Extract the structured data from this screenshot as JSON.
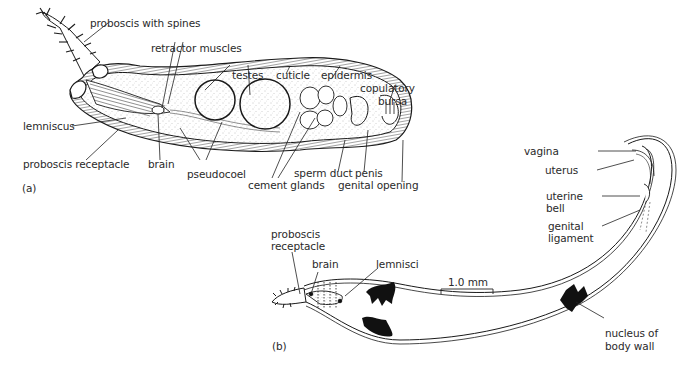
{
  "figure": {
    "panel_a": {
      "tag": "(a)",
      "labels": {
        "proboscis_spines": "proboscis with spines",
        "retractor_muscles": "retractor muscles",
        "testes": "testes",
        "cuticle": "cuticle",
        "epidermis": "epidermis",
        "copulatory_bursa_1": "copulatory",
        "copulatory_bursa_2": "bursa",
        "lemniscus": "lemniscus",
        "proboscis_receptacle": "proboscis receptacle",
        "brain": "brain",
        "pseudocoel": "pseudocoel",
        "cement_glands": "cement glands",
        "sperm_duct": "sperm duct",
        "penis": "penis",
        "genital_opening": "genital opening"
      }
    },
    "panel_b": {
      "tag": "(b)",
      "labels": {
        "proboscis_receptacle_1": "proboscis",
        "proboscis_receptacle_2": "receptacle",
        "brain": "brain",
        "lemnisci": "lemnisci",
        "scale_bar": "1.0 mm",
        "vagina": "vagina",
        "uterus": "uterus",
        "uterine_bell_1": "uterine",
        "uterine_bell_2": "bell",
        "genital_ligament_1": "genital",
        "genital_ligament_2": "ligament",
        "nucleus_body_wall_1": "nucleus of",
        "nucleus_body_wall_2": "body wall"
      }
    },
    "colors": {
      "ink": "#1a1a1a",
      "stipple": "#9a9a9a",
      "background": "#ffffff"
    }
  }
}
